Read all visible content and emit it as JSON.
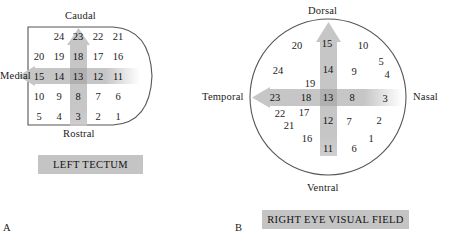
{
  "figure": {
    "background_color": "#ffffff",
    "band_color": "#c6c6c6",
    "band_color_dark": "#b0b0b0",
    "caption_bg_color": "#c4c4c4",
    "outline_color": "#555555"
  },
  "panel_a": {
    "letter": "A",
    "caption": "LEFT TECTUM",
    "shape": "left-tectum-outline",
    "directions": {
      "top": "Caudal",
      "bottom": "Rostral",
      "left": "Medial"
    },
    "arrows": {
      "vertical": {
        "points_to": "Caudal",
        "direction": "up"
      },
      "horizontal": {
        "points_to": "Medial",
        "direction": "left"
      }
    },
    "grid_rows": [
      {
        "row": 1,
        "offset_cols": 1,
        "values": [
          24,
          23,
          22,
          21
        ]
      },
      {
        "row": 2,
        "offset_cols": 0,
        "values": [
          20,
          19,
          18,
          17,
          16
        ]
      },
      {
        "row": 3,
        "offset_cols": 0,
        "values": [
          15,
          14,
          13,
          12,
          11
        ]
      },
      {
        "row": 4,
        "offset_cols": 0,
        "values": [
          10,
          9,
          8,
          7,
          6
        ]
      },
      {
        "row": 5,
        "offset_cols": 0,
        "values": [
          5,
          4,
          3,
          2,
          1
        ]
      }
    ],
    "highlighted_vertical": [
      23,
      18,
      13,
      8,
      3
    ],
    "highlighted_horizontal": [
      15,
      14,
      13,
      12,
      11
    ],
    "numbers": [
      {
        "label": "24",
        "x": 59,
        "y": 36,
        "band": false
      },
      {
        "label": "23",
        "x": 78,
        "y": 36,
        "band": true
      },
      {
        "label": "22",
        "x": 98,
        "y": 36,
        "band": false
      },
      {
        "label": "21",
        "x": 118,
        "y": 36,
        "band": false
      },
      {
        "label": "20",
        "x": 39,
        "y": 56,
        "band": false
      },
      {
        "label": "19",
        "x": 59,
        "y": 56,
        "band": false
      },
      {
        "label": "18",
        "x": 78,
        "y": 56,
        "band": true
      },
      {
        "label": "17",
        "x": 98,
        "y": 56,
        "band": false
      },
      {
        "label": "16",
        "x": 118,
        "y": 56,
        "band": false
      },
      {
        "label": "15",
        "x": 39,
        "y": 76,
        "band": true
      },
      {
        "label": "14",
        "x": 59,
        "y": 76,
        "band": true
      },
      {
        "label": "13",
        "x": 78,
        "y": 76,
        "band": true
      },
      {
        "label": "12",
        "x": 98,
        "y": 76,
        "band": true
      },
      {
        "label": "11",
        "x": 118,
        "y": 76,
        "band": true
      },
      {
        "label": "10",
        "x": 39,
        "y": 96,
        "band": false
      },
      {
        "label": "9",
        "x": 59,
        "y": 96,
        "band": false
      },
      {
        "label": "8",
        "x": 78,
        "y": 96,
        "band": true
      },
      {
        "label": "7",
        "x": 98,
        "y": 96,
        "band": false
      },
      {
        "label": "6",
        "x": 118,
        "y": 96,
        "band": false
      },
      {
        "label": "5",
        "x": 39,
        "y": 116,
        "band": false
      },
      {
        "label": "4",
        "x": 59,
        "y": 116,
        "band": false
      },
      {
        "label": "3",
        "x": 78,
        "y": 116,
        "band": true
      },
      {
        "label": "2",
        "x": 98,
        "y": 116,
        "band": false
      },
      {
        "label": "1",
        "x": 118,
        "y": 116,
        "band": false
      }
    ]
  },
  "panel_b": {
    "letter": "B",
    "caption": "RIGHT EYE VISUAL FIELD",
    "shape": "right-eye-visual-field-circle",
    "directions": {
      "top": "Dorsal",
      "bottom": "Ventral",
      "left": "Temporal",
      "right": "Nasal"
    },
    "arrows": {
      "vertical": {
        "points_to": "Dorsal",
        "direction": "up"
      },
      "horizontal": {
        "points_to": "Temporal",
        "direction": "left"
      }
    },
    "highlighted_vertical": [
      15,
      14,
      13,
      12,
      11
    ],
    "highlighted_horizontal": [
      23,
      18,
      13,
      8,
      3
    ],
    "numbers": [
      {
        "label": "20",
        "x": 97,
        "y": 45,
        "band": false
      },
      {
        "label": "15",
        "x": 127,
        "y": 43,
        "band": true
      },
      {
        "label": "10",
        "x": 163,
        "y": 45,
        "band": false
      },
      {
        "label": "24",
        "x": 78,
        "y": 70,
        "band": false
      },
      {
        "label": "14",
        "x": 128,
        "y": 69,
        "band": true
      },
      {
        "label": "9",
        "x": 154,
        "y": 71,
        "band": false
      },
      {
        "label": "5",
        "x": 181,
        "y": 61,
        "band": false
      },
      {
        "label": "4",
        "x": 187,
        "y": 74,
        "band": false
      },
      {
        "label": "19",
        "x": 110,
        "y": 83,
        "band": false
      },
      {
        "label": "23",
        "x": 75,
        "y": 97,
        "band": true
      },
      {
        "label": "18",
        "x": 106,
        "y": 97,
        "band": true
      },
      {
        "label": "13",
        "x": 128,
        "y": 97,
        "band": true
      },
      {
        "label": "8",
        "x": 152,
        "y": 97,
        "band": true
      },
      {
        "label": "3",
        "x": 185,
        "y": 98,
        "band": true
      },
      {
        "label": "22",
        "x": 80,
        "y": 113,
        "band": false
      },
      {
        "label": "17",
        "x": 104,
        "y": 112,
        "band": false
      },
      {
        "label": "12",
        "x": 128,
        "y": 120,
        "band": true
      },
      {
        "label": "7",
        "x": 149,
        "y": 121,
        "band": false
      },
      {
        "label": "2",
        "x": 179,
        "y": 120,
        "band": false
      },
      {
        "label": "21",
        "x": 89,
        "y": 125,
        "band": false
      },
      {
        "label": "16",
        "x": 107,
        "y": 138,
        "band": false
      },
      {
        "label": "1",
        "x": 171,
        "y": 138,
        "band": false
      },
      {
        "label": "11",
        "x": 128,
        "y": 148,
        "band": true
      },
      {
        "label": "6",
        "x": 154,
        "y": 148,
        "band": false
      }
    ]
  }
}
